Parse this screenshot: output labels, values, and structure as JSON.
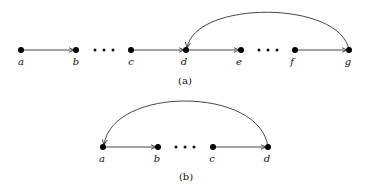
{
  "diagrams": [
    {
      "caption": "(a)",
      "nodes": [
        {
          "id": "a",
          "label": "a",
          "x": 21,
          "y": 50
        },
        {
          "id": "b",
          "label": "b",
          "x": 76,
          "y": 50
        },
        {
          "id": "c",
          "label": "c",
          "x": 131,
          "y": 50
        },
        {
          "id": "d",
          "label": "d",
          "x": 186,
          "y": 50
        },
        {
          "id": "e",
          "label": "e",
          "x": 241,
          "y": 50
        },
        {
          "id": "f",
          "label": "f",
          "x": 295,
          "y": 50
        },
        {
          "id": "g",
          "label": "g",
          "x": 349,
          "y": 50
        }
      ],
      "edges": [
        {
          "from": "a",
          "to": "b",
          "type": "straight"
        },
        {
          "from": "c",
          "to": "d",
          "type": "straight"
        },
        {
          "from": "d",
          "to": "e",
          "type": "straight"
        },
        {
          "from": "f",
          "to": "g",
          "type": "straight"
        },
        {
          "from": "g",
          "to": "d",
          "type": "arc"
        }
      ],
      "ellipses": [
        {
          "between": [
            "b",
            "c"
          ]
        },
        {
          "between": [
            "e",
            "f"
          ]
        }
      ]
    },
    {
      "caption": "(b)",
      "nodes": [
        {
          "id": "a",
          "label": "a",
          "x": 103,
          "y": 147
        },
        {
          "id": "b",
          "label": "b",
          "x": 158,
          "y": 147
        },
        {
          "id": "c",
          "label": "c",
          "x": 213,
          "y": 147
        },
        {
          "id": "d",
          "label": "d",
          "x": 268,
          "y": 147
        }
      ],
      "edges": [
        {
          "from": "a",
          "to": "b",
          "type": "straight"
        },
        {
          "from": "c",
          "to": "d",
          "type": "straight"
        },
        {
          "from": "d",
          "to": "a",
          "type": "arc"
        }
      ],
      "ellipses": [
        {
          "between": [
            "b",
            "c"
          ]
        }
      ]
    }
  ]
}
